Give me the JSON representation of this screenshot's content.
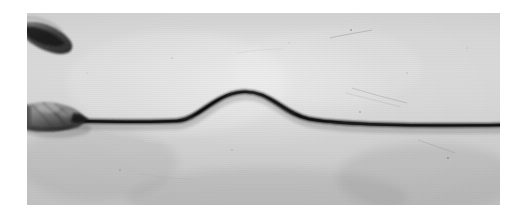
{
  "image": {
    "kind": "photograph",
    "medium": "black-and-white photographic print",
    "subject": "transverse wave pulse on a stretched rope held by a hand",
    "caption_visible": "",
    "width_px": 526,
    "height_px": 223
  },
  "frame": {
    "border_color": "#ffffff",
    "border_left_px": 27,
    "border_top_px": 13,
    "plate_width_px": 473,
    "plate_height_px": 192
  },
  "palette": {
    "background_light": "#d8d8d8",
    "background_mid": "#cfcfcf",
    "background_dark": "#c2c2c2",
    "rope_black": "#141414",
    "rope_core": "#262626",
    "hand_dark": "#3a3a3a",
    "hand_mid": "#6e6e6e",
    "hand_light": "#a8a8a8",
    "white": "#ffffff"
  },
  "scene": {
    "objects": [
      {
        "name": "rope",
        "label": "Rope / cord under tension",
        "color": "#141414",
        "stroke_width_px": 4.4,
        "baseline_left_y_px": 118,
        "baseline_right_y_px": 121,
        "enters_at_x_px": 38,
        "exits_at_x_px": 473
      },
      {
        "name": "wave-pulse",
        "label": "Single transverse wave pulse (hump)",
        "crest_x_px": 223,
        "crest_y_px": 85,
        "baseline_y_px": 107,
        "amplitude_px": 22,
        "start_x_px": 158,
        "end_x_px": 305,
        "width_px": 147,
        "direction": "rightward"
      },
      {
        "name": "hand",
        "label": "Hand gripping the end of the rope",
        "x_px": 2,
        "y_px": 88,
        "width_px": 58,
        "height_px": 30
      },
      {
        "name": "thumb-shadow",
        "label": "Dark curved form at upper left (thumb / clamp edge)",
        "x_px": 0,
        "y_px": 14,
        "width_px": 48,
        "height_px": 40
      }
    ],
    "marks": [
      {
        "name": "scratch-upper-right",
        "x1_px": 330,
        "y1_px": 38,
        "x2_px": 372,
        "y2_px": 30
      },
      {
        "name": "scratch-near-rope-right",
        "x1_px": 352,
        "y1_px": 88,
        "x2_px": 405,
        "y2_px": 100
      },
      {
        "name": "scratch-lower-right",
        "x1_px": 418,
        "y1_px": 140,
        "x2_px": 452,
        "y2_px": 152
      },
      {
        "name": "speckle-a",
        "x_px": 351,
        "y_px": 30
      },
      {
        "name": "speckle-b",
        "x_px": 360,
        "y_px": 112
      },
      {
        "name": "speckle-c",
        "x_px": 172,
        "y_px": 58
      },
      {
        "name": "speckle-d",
        "x_px": 448,
        "y_px": 158
      },
      {
        "name": "speckle-e",
        "x_px": 232,
        "y_px": 150
      },
      {
        "name": "speckle-f",
        "x_px": 120,
        "y_px": 170
      }
    ]
  }
}
